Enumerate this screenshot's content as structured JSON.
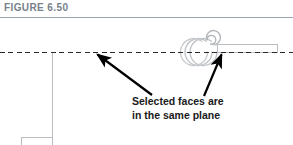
{
  "figure": {
    "caption": "FIGURE 6.50",
    "rule_color": "#9aa2ab",
    "caption_color": "#77818c"
  },
  "annotation": {
    "line1": "Selected faces are",
    "line2": "in the same plane",
    "color": "#1a1a1a"
  },
  "diagram": {
    "type": "technical-drawing",
    "plane_line": {
      "name": "datum-plane-dashed-line",
      "style": "dashed",
      "color": "#2a2a2a",
      "y": 52,
      "x_start": 0,
      "x_end": 293
    },
    "geometry_color": "#b9bcc0",
    "arrows": [
      {
        "name": "left-callout-arrow",
        "from_x": 152,
        "from_y": 95,
        "to_x": 96,
        "to_y": 53,
        "color": "#000000"
      },
      {
        "name": "right-callout-arrow",
        "from_x": 204,
        "from_y": 96,
        "to_x": 222,
        "to_y": 53,
        "color": "#000000"
      }
    ]
  }
}
